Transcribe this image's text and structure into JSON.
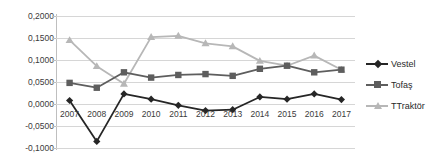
{
  "chart_data": {
    "type": "line",
    "title": "",
    "subtitle": "",
    "xlabel": "",
    "ylabel": "",
    "categories": [
      "2007",
      "2008",
      "2009",
      "2010",
      "2011",
      "2012",
      "2013",
      "2014",
      "2015",
      "2016",
      "2017"
    ],
    "x": [
      2007,
      2008,
      2009,
      2010,
      2011,
      2012,
      2013,
      2014,
      2015,
      2016,
      2017
    ],
    "ylim": [
      -0.1,
      0.2
    ],
    "y_ticks": [
      0.2,
      0.15,
      0.1,
      0.05,
      0.0,
      -0.05,
      -0.1
    ],
    "y_tick_labels": [
      "0,2000",
      "0,1500",
      "0,1000",
      "0,0500",
      "0,0000",
      "-0,0500",
      "-0,1000"
    ],
    "grid": true,
    "legend_position": "right",
    "decimal_separator": ",",
    "series": [
      {
        "name": "Vestel",
        "color": "#262626",
        "marker": "diamond",
        "values": [
          0.008,
          -0.085,
          0.023,
          0.011,
          -0.003,
          -0.015,
          -0.013,
          0.016,
          0.011,
          0.023,
          0.01
        ]
      },
      {
        "name": "Tofaş",
        "color": "#5e5e5e",
        "marker": "square",
        "values": [
          0.048,
          0.037,
          0.072,
          0.06,
          0.066,
          0.068,
          0.064,
          0.08,
          0.087,
          0.072,
          0.078
        ]
      },
      {
        "name": "TTraktör",
        "color": "#b7b7b7",
        "marker": "triangle",
        "values": [
          0.145,
          0.086,
          0.046,
          0.152,
          0.155,
          0.138,
          0.131,
          0.098,
          0.087,
          0.11,
          0.078
        ]
      }
    ]
  },
  "legend": {
    "items": [
      {
        "label": "Vestel"
      },
      {
        "label": "Tofaş"
      },
      {
        "label": "TTraktör"
      }
    ]
  },
  "axes": {
    "y_tick_labels": [
      "0,2000",
      "0,1500",
      "0,1000",
      "0,0500",
      "0,0000",
      "-0,0500",
      "-0,1000"
    ],
    "x_tick_labels": [
      "2007",
      "2008",
      "2009",
      "2010",
      "2011",
      "2012",
      "2013",
      "2014",
      "2015",
      "2016",
      "2017"
    ]
  }
}
